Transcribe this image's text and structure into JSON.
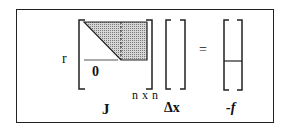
{
  "diagram": {
    "row_label": "r",
    "zero_label": "0",
    "dimension_label": "n x n",
    "jacobian_label": "J",
    "delta_x_label": "Δx",
    "equals_sign": "=",
    "rhs_label": "-f"
  },
  "colors": {
    "border": "#222222",
    "shaded_fill": "#b5b5b5",
    "background": "#ffffff"
  }
}
